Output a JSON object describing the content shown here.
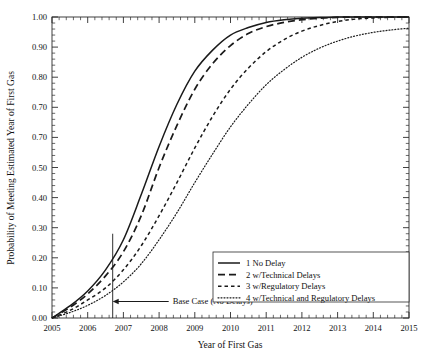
{
  "chart_data": {
    "type": "line",
    "title": "",
    "xlabel": "Year of First Gas",
    "ylabel": "Probability of Meeting Estimated Year of First Gas",
    "xlim": [
      2005,
      2015
    ],
    "ylim": [
      0.0,
      1.0
    ],
    "grid": false,
    "legend_position": "bottom-right",
    "x_tick_labels": [
      "2005",
      "2006",
      "2007",
      "2008",
      "2009",
      "2010",
      "2011",
      "2012",
      "2013",
      "2014",
      "2015"
    ],
    "x_tick_values": [
      2005,
      2006,
      2007,
      2008,
      2009,
      2010,
      2011,
      2012,
      2013,
      2014,
      2015
    ],
    "y_tick_labels": [
      "0.00",
      "0.10",
      "0.20",
      "0.30",
      "0.40",
      "0.50",
      "0.70",
      "0.70",
      "0.80",
      "0.90",
      "1.00"
    ],
    "y_tick_values": [
      0.0,
      0.1,
      0.2,
      0.3,
      0.4,
      0.5,
      0.6,
      0.7,
      0.8,
      0.9,
      1.0
    ],
    "x": [
      2005,
      2005.5,
      2006,
      2006.5,
      2007,
      2007.5,
      2008,
      2008.5,
      2009,
      2009.5,
      2010,
      2010.5,
      2011,
      2011.5,
      2012,
      2012.5,
      2013,
      2013.5,
      2014,
      2014.5,
      2015
    ],
    "series": [
      {
        "name": "1 No Delay",
        "style": "solid",
        "values": [
          0.0,
          0.04,
          0.09,
          0.16,
          0.26,
          0.41,
          0.57,
          0.71,
          0.82,
          0.89,
          0.94,
          0.965,
          0.982,
          0.991,
          0.996,
          0.998,
          1.0,
          1.0,
          1.0,
          1.0,
          1.0
        ]
      },
      {
        "name": "2 w/Technical Delays",
        "style": "dashed-long",
        "values": [
          0.0,
          0.035,
          0.08,
          0.14,
          0.22,
          0.34,
          0.5,
          0.64,
          0.76,
          0.845,
          0.905,
          0.945,
          0.968,
          0.982,
          0.991,
          0.996,
          0.999,
          1.0,
          1.0,
          1.0,
          1.0
        ]
      },
      {
        "name": "3 w/Regulatory Delays",
        "style": "dashed-short",
        "values": [
          0.0,
          0.025,
          0.06,
          0.1,
          0.16,
          0.24,
          0.34,
          0.45,
          0.565,
          0.67,
          0.76,
          0.83,
          0.885,
          0.925,
          0.953,
          0.972,
          0.985,
          0.993,
          0.997,
          0.999,
          1.0
        ]
      },
      {
        "name": "4 w/Technical and Regulatory Delays",
        "style": "dotted",
        "values": [
          0.0,
          0.018,
          0.042,
          0.075,
          0.12,
          0.18,
          0.26,
          0.35,
          0.45,
          0.545,
          0.635,
          0.71,
          0.775,
          0.825,
          0.866,
          0.897,
          0.92,
          0.937,
          0.949,
          0.957,
          0.963
        ]
      }
    ],
    "annotations": [
      {
        "text": "Base Case (No Delays)",
        "x": 2006.7,
        "y": 0.055,
        "marker_x": 2006.7,
        "marker_y_top": 0.28,
        "arrow": "left"
      }
    ]
  },
  "legend": {
    "entries": [
      {
        "label": "1 No Delay",
        "style": "solid"
      },
      {
        "label": "2 w/Technical Delays",
        "style": "dashed-long"
      },
      {
        "label": "3 w/Regulatory Delays",
        "style": "dashed-short"
      },
      {
        "label": "4 w/Technical and Regulatory Delays",
        "style": "dotted"
      }
    ]
  }
}
